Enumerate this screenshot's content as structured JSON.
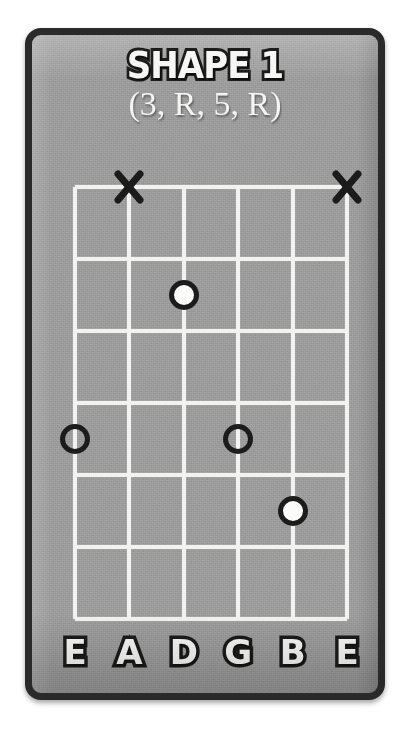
{
  "card": {
    "background_color": "#9b9b9b",
    "border_color": "#2a2a2a"
  },
  "title": {
    "main": "SHAPE 1",
    "subtitle": "(3, R, 5, R)"
  },
  "fretboard": {
    "string_count": 6,
    "fret_count": 6,
    "line_color": "#f2f2f0",
    "string_labels": [
      "E",
      "A",
      "D",
      "G",
      "B",
      "E"
    ]
  },
  "mutes": [
    {
      "name": "mute-x-string-a",
      "string_index": 1,
      "glyph": "X"
    },
    {
      "name": "mute-x-string-high-e",
      "string_index": 5,
      "glyph": "X"
    }
  ],
  "markers": [
    {
      "name": "marker-d-fret2",
      "string_index": 2,
      "fret": 2,
      "style": "filled"
    },
    {
      "name": "marker-low-e-fret4",
      "string_index": 0,
      "fret": 4,
      "style": "open"
    },
    {
      "name": "marker-g-fret4",
      "string_index": 3,
      "fret": 4,
      "style": "open"
    },
    {
      "name": "marker-b-fret5",
      "string_index": 4,
      "fret": 5,
      "style": "filled"
    }
  ],
  "chart_data": {
    "type": "table",
    "title": "SHAPE 1",
    "subtitle": "(3, R, 5, R)",
    "xlabel": "Strings",
    "ylabel": "Frets",
    "categories": [
      "E",
      "A",
      "D",
      "G",
      "B",
      "E"
    ],
    "series": [
      {
        "name": "fret_position",
        "values": [
          4,
          null,
          2,
          4,
          5,
          null
        ]
      },
      {
        "name": "marker_style",
        "values": [
          "open",
          "muted",
          "filled",
          "open",
          "filled",
          "muted"
        ]
      }
    ],
    "ylim": [
      0,
      6
    ],
    "grid": true,
    "legend": "none",
    "annotations": [
      "X above string A (muted)",
      "X above string high E (muted)"
    ]
  }
}
